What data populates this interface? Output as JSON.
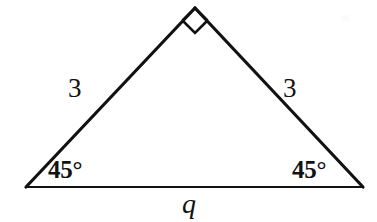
{
  "figure": {
    "type": "geometry-diagram",
    "shape": "isosceles-right-triangle",
    "background_color": "#ffffff",
    "stroke_color": "#121212",
    "text_color": "#121212"
  },
  "labels": {
    "side_left": "3",
    "side_right": "3",
    "angle_left": "45°",
    "angle_right": "45°",
    "base": "q"
  },
  "geometry": {
    "apex": {
      "x": 195,
      "y": 8
    },
    "bottom_left": {
      "x": 26,
      "y": 187
    },
    "bottom_right": {
      "x": 363,
      "y": 187
    },
    "leg_stroke_width": 3.2,
    "base_stroke_width": 2.2,
    "right_angle_marker": {
      "name": "right-angle-square",
      "size": 25,
      "stroke_width": 2.6
    }
  },
  "measures": {
    "leg_length": "3",
    "base_length_variable": "q",
    "base_angle_degrees": "45",
    "apex_angle_degrees": "90"
  }
}
